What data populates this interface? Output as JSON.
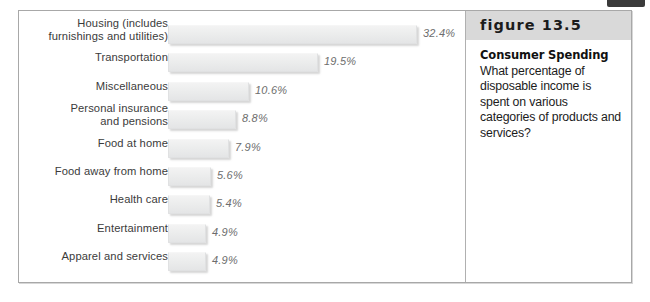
{
  "figure": {
    "number_label": "figure 13.5",
    "heading": "Consumer Spending",
    "caption": "What percentage of disposable income is spent on various categories of products and services?"
  },
  "colors": {
    "frame_border": "#a8a8a8",
    "bar_fill": "#ececed",
    "bar_shadow": "rgba(120,120,120,0.30)",
    "band_background": "#d9d9d9",
    "label_text": "#3b3b3b",
    "value_text": "#6d6d6d",
    "caption_text": "#1c1c1c"
  },
  "chart_data": {
    "type": "bar",
    "orientation": "horizontal",
    "title": "Consumer Spending",
    "xlabel": "",
    "ylabel": "",
    "value_suffix": "%",
    "grid": false,
    "legend": "none",
    "xlim": [
      0,
      32.4
    ],
    "categories": [
      "Housing (includes furnishings and utilities)",
      "Transportation",
      "Miscellaneous",
      "Personal insurance and pensions",
      "Food at home",
      "Food away from home",
      "Health care",
      "Entertainment",
      "Apparel and services"
    ],
    "values": [
      32.4,
      19.5,
      10.6,
      8.8,
      7.9,
      5.6,
      5.4,
      4.9,
      4.9
    ],
    "value_labels": [
      "32.4%",
      "19.5%",
      "10.6%",
      "8.8%",
      "7.9%",
      "5.6%",
      "5.4%",
      "4.9%",
      "4.9%"
    ]
  },
  "rows": [
    {
      "label_line1": "Housing (includes",
      "label_line2": "furnishings and utilities)",
      "value_label": "32.4%",
      "value": 32.4
    },
    {
      "label_line1": "Transportation",
      "label_line2": "",
      "value_label": "19.5%",
      "value": 19.5
    },
    {
      "label_line1": "Miscellaneous",
      "label_line2": "",
      "value_label": "10.6%",
      "value": 10.6
    },
    {
      "label_line1": "Personal insurance",
      "label_line2": "and pensions",
      "value_label": "8.8%",
      "value": 8.8
    },
    {
      "label_line1": "Food at home",
      "label_line2": "",
      "value_label": "7.9%",
      "value": 7.9
    },
    {
      "label_line1": "Food away from home",
      "label_line2": "",
      "value_label": "5.6%",
      "value": 5.6
    },
    {
      "label_line1": "Health care",
      "label_line2": "",
      "value_label": "5.4%",
      "value": 5.4
    },
    {
      "label_line1": "Entertainment",
      "label_line2": "",
      "value_label": "4.9%",
      "value": 4.9
    },
    {
      "label_line1": "Apparel and services",
      "label_line2": "",
      "value_label": "4.9%",
      "value": 4.9
    }
  ]
}
